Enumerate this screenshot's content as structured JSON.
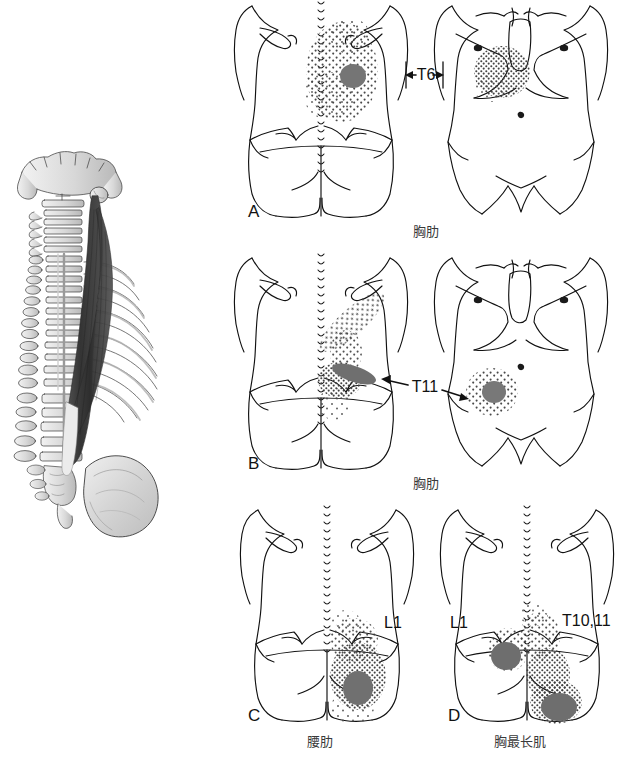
{
  "figure": {
    "background_color": "#ffffff",
    "line_color": "#1a1a1a",
    "essential_zone_color": "#7d7d7d",
    "spillover_dot_color": "#4a4a4a",
    "bone_shade_color": "#c9c9c9",
    "muscle_shade_color": "#3c3c3c"
  },
  "anatomy_panel": {
    "name": "spine-rib-cage-erector-spinae-illustration",
    "view": "posterior-oblique",
    "structures": [
      "occipital-bone",
      "mastoid-process",
      "cervical-vertebrae",
      "thoracic-vertebrae",
      "lumbar-vertebrae",
      "ribs",
      "ilium",
      "sacrum",
      "longissimus-thoracis-muscle",
      "iliocostalis-muscle"
    ]
  },
  "panels": [
    {
      "id": "A",
      "letter": "A",
      "caption": "胸肋",
      "level_label": "T6",
      "arrow_style": "tick-arrows",
      "views": [
        "posterior",
        "anterior"
      ],
      "pain_pattern": {
        "posterior": {
          "essential_zones": 1,
          "spillover": "broad-mid-back"
        },
        "anterior": {
          "essential_zones": 0,
          "spillover": "left-upper-chest"
        }
      }
    },
    {
      "id": "B",
      "letter": "B",
      "caption": "胸肋",
      "level_label": "T11",
      "arrow_style": "long-arrows",
      "views": [
        "posterior",
        "anterior"
      ],
      "pain_pattern": {
        "posterior": {
          "essential_zones": 1,
          "spillover": "diagonal-to-scapula"
        },
        "anterior": {
          "essential_zones": 1,
          "spillover": "left-lower-abdomen"
        }
      }
    },
    {
      "id": "C",
      "letter": "C",
      "caption": "腰肋",
      "level_label": "L1",
      "arrow_style": "none",
      "views": [
        "posterior"
      ],
      "pain_pattern": {
        "posterior": {
          "essential_zones": 1,
          "spillover": "lower-back-to-buttock"
        }
      }
    },
    {
      "id": "D",
      "letter": "D",
      "caption": "胸最长肌",
      "level_label_left": "L1",
      "level_label_right": "T10,11",
      "arrow_style": "none",
      "views": [
        "posterior"
      ],
      "pain_pattern": {
        "posterior": {
          "essential_zones": 2,
          "spillover": "lumbar-and-buttocks"
        }
      }
    }
  ]
}
